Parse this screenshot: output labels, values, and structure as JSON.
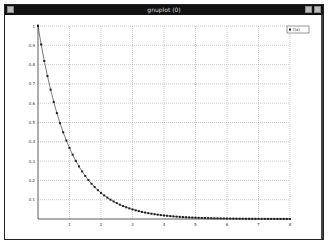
{
  "window": {
    "title": "gnuplot (0)",
    "buttons": {
      "menu": "window-menu",
      "minimize": "minimize",
      "maximize": "maximize"
    }
  },
  "colors": {
    "titlebar": "#111111",
    "curve": "#222222",
    "grid": "#999999",
    "axis": "#333333"
  },
  "chart_data": {
    "type": "line",
    "title": "",
    "xlabel": "",
    "ylabel": "",
    "xlim": [
      0,
      8
    ],
    "ylim": [
      0,
      1
    ],
    "grid": true,
    "legend_position": "top-right",
    "x_ticks": [
      "1",
      "2",
      "3",
      "4",
      "5",
      "6",
      "7",
      "8"
    ],
    "y_ticks": [
      "0.1",
      "0.2",
      "0.3",
      "0.4",
      "0.5",
      "0.6",
      "0.7",
      "0.8",
      "0.9",
      "1"
    ],
    "series": [
      {
        "name": "f(x)",
        "function": "exp(-x)",
        "marker": "square",
        "x_start": 0,
        "x_end": 8,
        "x_step": 0.1
      }
    ]
  }
}
